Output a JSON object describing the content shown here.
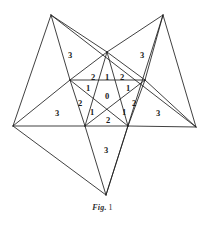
{
  "figure": {
    "caption_prefix": "Fig.",
    "caption_number": "1",
    "stroke_color": "#1f1f1f",
    "background_color": "#ffffff",
    "label_color": "#1a1a1a"
  },
  "diagram": {
    "type": "pentagram",
    "outer_points": [
      {
        "name": "top-left-point",
        "x": 51,
        "y": 15
      },
      {
        "name": "top-right-point",
        "x": 163,
        "y": 15
      },
      {
        "name": "right-point",
        "x": 196,
        "y": 127
      },
      {
        "name": "bottom-point",
        "x": 106,
        "y": 195
      },
      {
        "name": "left-point",
        "x": 13,
        "y": 126
      }
    ],
    "inner_vertices": [
      {
        "name": "apex",
        "x": 107,
        "y": 52
      },
      {
        "name": "upper-left",
        "x": 70,
        "y": 80
      },
      {
        "name": "upper-right",
        "x": 145,
        "y": 80
      },
      {
        "name": "lower-left",
        "x": 85,
        "y": 126
      },
      {
        "name": "lower-right",
        "x": 128,
        "y": 126
      }
    ],
    "region_labels": [
      {
        "id": "outer-upper-left",
        "value": "3",
        "x": 70,
        "y": 55
      },
      {
        "id": "outer-upper-right",
        "value": "3",
        "x": 142,
        "y": 55
      },
      {
        "id": "outer-left",
        "value": "3",
        "x": 57,
        "y": 113
      },
      {
        "id": "outer-right",
        "value": "3",
        "x": 158,
        "y": 113
      },
      {
        "id": "outer-bottom",
        "value": "3",
        "x": 106,
        "y": 150
      },
      {
        "id": "mid-upper-left",
        "value": "2",
        "x": 93,
        "y": 77
      },
      {
        "id": "mid-apex",
        "value": "1",
        "x": 107,
        "y": 77
      },
      {
        "id": "mid-upper-right",
        "value": "2",
        "x": 122,
        "y": 77
      },
      {
        "id": "inner-upper-left",
        "value": "1",
        "x": 88,
        "y": 88
      },
      {
        "id": "inner-upper-right",
        "value": "1",
        "x": 128,
        "y": 88
      },
      {
        "id": "center",
        "value": "0",
        "x": 107,
        "y": 96
      },
      {
        "id": "mid-left",
        "value": "2",
        "x": 80,
        "y": 103
      },
      {
        "id": "mid-right",
        "value": "2",
        "x": 134,
        "y": 103
      },
      {
        "id": "inner-lower-left",
        "value": "1",
        "x": 92,
        "y": 112
      },
      {
        "id": "inner-lower-right",
        "value": "1",
        "x": 124,
        "y": 112
      },
      {
        "id": "mid-bottom",
        "value": "2",
        "x": 108,
        "y": 120
      }
    ]
  }
}
